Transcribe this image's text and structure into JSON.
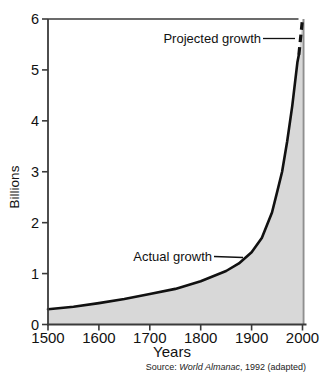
{
  "figure": {
    "source": {
      "prefix": "Source: ",
      "work": "World Almanac",
      "suffix": ", 1992 (adapted)"
    }
  },
  "chart_data": {
    "type": "area",
    "title": "",
    "xlabel": "Years",
    "ylabel": "Billions",
    "xlim": [
      1500,
      2000
    ],
    "ylim": [
      0,
      6
    ],
    "x_ticks": [
      1500,
      1600,
      1700,
      1800,
      1900,
      2000
    ],
    "y_ticks": [
      0,
      1,
      2,
      3,
      4,
      5,
      6
    ],
    "grid": false,
    "legend": "inline-annotations",
    "fill_color": "#d8d8d8",
    "line_color": "#111111",
    "frame_color": "#3a3a3a",
    "series": [
      {
        "name": "Actual growth",
        "line": "solid",
        "points": [
          [
            1500,
            0.3
          ],
          [
            1550,
            0.35
          ],
          [
            1600,
            0.42
          ],
          [
            1650,
            0.5
          ],
          [
            1700,
            0.6
          ],
          [
            1750,
            0.7
          ],
          [
            1800,
            0.85
          ],
          [
            1850,
            1.05
          ],
          [
            1875,
            1.2
          ],
          [
            1900,
            1.42
          ],
          [
            1920,
            1.7
          ],
          [
            1940,
            2.2
          ],
          [
            1950,
            2.6
          ],
          [
            1960,
            3.0
          ],
          [
            1970,
            3.6
          ],
          [
            1980,
            4.3
          ],
          [
            1990,
            5.15
          ],
          [
            1993,
            5.3
          ]
        ]
      },
      {
        "name": "Projected growth",
        "line": "dashed",
        "points": [
          [
            1993,
            5.3
          ],
          [
            2000,
            6.0
          ]
        ]
      }
    ]
  }
}
